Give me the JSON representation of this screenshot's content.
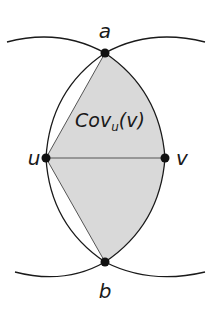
{
  "diagram": {
    "region_label": {
      "main": "Cov",
      "subscript": "u",
      "arg": "(v)"
    },
    "vertices": [
      {
        "id": "a",
        "label": "a",
        "x": 105,
        "y": 53
      },
      {
        "id": "u",
        "label": "u",
        "x": 46,
        "y": 158
      },
      {
        "id": "v",
        "label": "v",
        "x": 165,
        "y": 158
      },
      {
        "id": "b",
        "label": "b",
        "x": 105,
        "y": 262
      }
    ],
    "edges": [
      {
        "from": "u",
        "to": "v",
        "type": "segment"
      },
      {
        "from": "a",
        "to": "u",
        "type": "segment"
      },
      {
        "from": "b",
        "to": "u",
        "type": "segment"
      }
    ],
    "colors": {
      "stroke": "#1a1a1a",
      "fill": "#d9d9d9",
      "vertex": "#111111"
    }
  }
}
